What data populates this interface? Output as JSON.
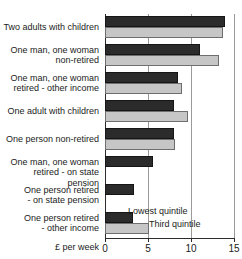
{
  "chart_data": {
    "type": "bar",
    "orientation": "horizontal",
    "title": "",
    "xlabel": "£ per week",
    "ylabel": "",
    "xlim": [
      0,
      15
    ],
    "xticks": [
      "0",
      "5",
      "10",
      "15"
    ],
    "xtick_values": [
      0,
      5,
      10,
      15
    ],
    "grid": "vertical",
    "legend_position": "inside-bottom",
    "categories": [
      "Two adults with children",
      "One man, one woman non-retired",
      "One man, one woman retired - other income",
      "One adult with children",
      "One person non-retired",
      "One man, one woman retired - on state pension",
      "One person retired - on state pension",
      "One person retired - other income"
    ],
    "category_lines": [
      [
        "Two adults with children"
      ],
      [
        "One man, one woman",
        "non-retired"
      ],
      [
        "One man, one woman",
        "retired - other income"
      ],
      [
        "One adult with children"
      ],
      [
        "One person non-retired"
      ],
      [
        "One man, one woman",
        "retired - on state pension"
      ],
      [
        "One person retired",
        "- on state pension"
      ],
      [
        "One person retired",
        "- other income"
      ]
    ],
    "series": [
      {
        "name": "Lowest quintile",
        "color": "#2b2b2b",
        "values": [
          13.9,
          11.1,
          8.5,
          8.0,
          8.0,
          5.6,
          3.4,
          3.3
        ]
      },
      {
        "name": "Third quintile",
        "color": "#c6c6c6",
        "values": [
          13.7,
          13.3,
          9.0,
          9.6,
          8.1,
          0,
          0,
          5.1
        ]
      }
    ]
  },
  "legend": {
    "lowest_label": "Lowest quintile",
    "third_label": "Third quintile"
  },
  "colors": {
    "lowest_quintile": "#2b2b2b",
    "third_quintile": "#c6c6c6",
    "axis": "#2b2b2b",
    "gridline": "#9a9a9a",
    "text": "#1b1b1b",
    "background": "#ffffff"
  }
}
